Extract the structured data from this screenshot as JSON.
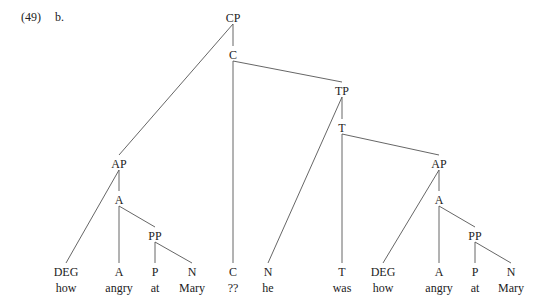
{
  "example": {
    "number": "(49)",
    "sub": "b."
  },
  "tree": {
    "nodes": [
      {
        "id": "CP",
        "label": "CP",
        "x": 233,
        "y": 18
      },
      {
        "id": "C1",
        "label": "C",
        "x": 233,
        "y": 55
      },
      {
        "id": "TP",
        "label": "TP",
        "x": 342,
        "y": 91
      },
      {
        "id": "T1",
        "label": "T",
        "x": 342,
        "y": 128
      },
      {
        "id": "AP1",
        "label": "AP",
        "x": 119,
        "y": 164
      },
      {
        "id": "A1",
        "label": "A",
        "x": 119,
        "y": 200
      },
      {
        "id": "PP1",
        "label": "PP",
        "x": 155,
        "y": 236
      },
      {
        "id": "AP2",
        "label": "AP",
        "x": 439,
        "y": 164
      },
      {
        "id": "A2",
        "label": "A",
        "x": 439,
        "y": 200
      },
      {
        "id": "PP2",
        "label": "PP",
        "x": 475,
        "y": 236
      },
      {
        "id": "DEG1",
        "label": "DEG",
        "word": "how",
        "x": 66,
        "y": 272
      },
      {
        "id": "Aleaf1",
        "label": "A",
        "word": "angry",
        "x": 119,
        "y": 272
      },
      {
        "id": "P1",
        "label": "P",
        "word": "at",
        "x": 155,
        "y": 272
      },
      {
        "id": "N1",
        "label": "N",
        "word": "Mary",
        "x": 192,
        "y": 272
      },
      {
        "id": "Cleaf",
        "label": "C",
        "word": "??",
        "x": 233,
        "y": 272
      },
      {
        "id": "Nhe",
        "label": "N",
        "word": "he",
        "x": 268,
        "y": 272
      },
      {
        "id": "Tleaf",
        "label": "T",
        "word": "was",
        "x": 342,
        "y": 272
      },
      {
        "id": "DEG2",
        "label": "DEG",
        "word": "how",
        "x": 383,
        "y": 272
      },
      {
        "id": "Aleaf2",
        "label": "A",
        "word": "angry",
        "x": 439,
        "y": 272
      },
      {
        "id": "P2",
        "label": "P",
        "word": "at",
        "x": 475,
        "y": 272
      },
      {
        "id": "N2",
        "label": "N",
        "word": "Mary",
        "x": 511,
        "y": 272
      }
    ],
    "edges": [
      [
        "CP",
        "AP1"
      ],
      [
        "CP",
        "C1"
      ],
      [
        "C1",
        "Cleaf"
      ],
      [
        "C1",
        "TP"
      ],
      [
        "TP",
        "Nhe"
      ],
      [
        "TP",
        "T1"
      ],
      [
        "T1",
        "Tleaf"
      ],
      [
        "T1",
        "AP2"
      ],
      [
        "AP1",
        "DEG1"
      ],
      [
        "AP1",
        "A1"
      ],
      [
        "A1",
        "Aleaf1"
      ],
      [
        "A1",
        "PP1"
      ],
      [
        "PP1",
        "P1"
      ],
      [
        "PP1",
        "N1"
      ],
      [
        "AP2",
        "DEG2"
      ],
      [
        "AP2",
        "A2"
      ],
      [
        "A2",
        "Aleaf2"
      ],
      [
        "A2",
        "PP2"
      ],
      [
        "PP2",
        "P2"
      ],
      [
        "PP2",
        "N2"
      ]
    ]
  }
}
